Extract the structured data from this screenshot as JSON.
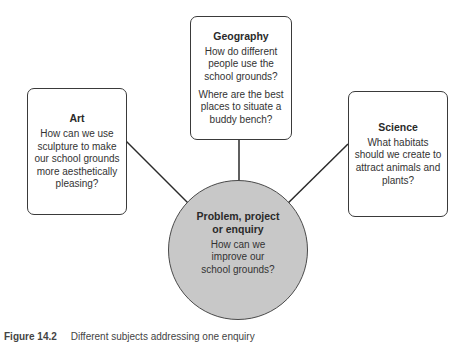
{
  "diagram": {
    "center": {
      "title": "Problem, project or enquiry",
      "title_line1": "Problem, project",
      "title_line2": "or enquiry",
      "question": "How can we improve our school grounds?",
      "fill_color": "#c8c8c8"
    },
    "nodes": [
      {
        "id": "art",
        "title": "Art",
        "questions": [
          "How can we use sculpture to make our school grounds more aesthetically pleasing?"
        ]
      },
      {
        "id": "geography",
        "title": "Geography",
        "questions": [
          "How do different people use the school grounds?",
          "Where are the best places to situate a buddy bench?"
        ]
      },
      {
        "id": "science",
        "title": "Science",
        "questions": [
          "What habitats should we create to attract animals and plants?"
        ]
      }
    ],
    "edges": [
      {
        "from": "art",
        "to": "center"
      },
      {
        "from": "geography",
        "to": "center"
      },
      {
        "from": "science",
        "to": "center"
      }
    ]
  },
  "caption": {
    "label": "Figure 14.2",
    "text": "Different subjects addressing one enquiry"
  }
}
